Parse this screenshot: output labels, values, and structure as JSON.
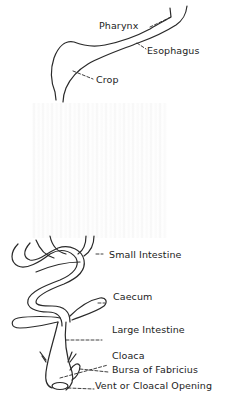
{
  "diagram": {
    "type": "anatomical-labeled-diagram",
    "colors": {
      "line": "#2a2a2a",
      "background": "#ffffff",
      "text": "#222222"
    },
    "labels": [
      {
        "id": "pharynx",
        "text": "Pharynx"
      },
      {
        "id": "esophagus",
        "text": "Esophagus"
      },
      {
        "id": "crop",
        "text": "Crop"
      },
      {
        "id": "small-intestine",
        "text": "Small Intestine"
      },
      {
        "id": "caecum",
        "text": "Caecum"
      },
      {
        "id": "large-intestine",
        "text": "Large Intestine"
      },
      {
        "id": "cloaca",
        "text": "Cloaca"
      },
      {
        "id": "bursa",
        "text": "Bursa of Fabricius"
      },
      {
        "id": "vent",
        "text": "Vent or Cloacal Opening"
      }
    ]
  }
}
